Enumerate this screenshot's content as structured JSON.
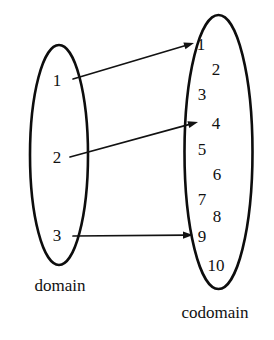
{
  "figure": {
    "kind": "function-mapping-diagram",
    "background_color": "#ffffff",
    "ink_color": "#111111",
    "width": 274,
    "height": 340
  },
  "domain": {
    "caption": "domain",
    "caption_pos": {
      "x": 60,
      "y": 285
    },
    "ellipse": {
      "cx": 59,
      "cy": 155,
      "rx": 29,
      "ry": 110
    },
    "elements": [
      {
        "label": "1",
        "x": 57,
        "y": 80
      },
      {
        "label": "2",
        "x": 57,
        "y": 157
      },
      {
        "label": "3",
        "x": 57,
        "y": 235
      }
    ]
  },
  "codomain": {
    "caption": "codomain",
    "caption_pos": {
      "x": 215,
      "y": 312
    },
    "ellipse": {
      "cx": 218.5,
      "cy": 152,
      "rx": 34,
      "ry": 137
    },
    "elements": [
      {
        "label": "1",
        "x": 201,
        "y": 44
      },
      {
        "label": "2",
        "x": 216,
        "y": 69
      },
      {
        "label": "3",
        "x": 202,
        "y": 94
      },
      {
        "label": "4",
        "x": 216,
        "y": 123
      },
      {
        "label": "5",
        "x": 202,
        "y": 149
      },
      {
        "label": "6",
        "x": 217,
        "y": 174
      },
      {
        "label": "7",
        "x": 202,
        "y": 199
      },
      {
        "label": "8",
        "x": 217,
        "y": 216
      },
      {
        "label": "9",
        "x": 202,
        "y": 236
      },
      {
        "label": "10",
        "x": 216,
        "y": 265
      }
    ]
  },
  "mappings": [
    {
      "from": "1",
      "to": "1",
      "x1": 73,
      "y1": 79,
      "x2": 194,
      "y2": 43
    },
    {
      "from": "2",
      "to": "4",
      "x1": 70,
      "y1": 157,
      "x2": 198,
      "y2": 122
    },
    {
      "from": "3",
      "to": "9",
      "x1": 73,
      "y1": 236,
      "x2": 193,
      "y2": 235
    }
  ]
}
